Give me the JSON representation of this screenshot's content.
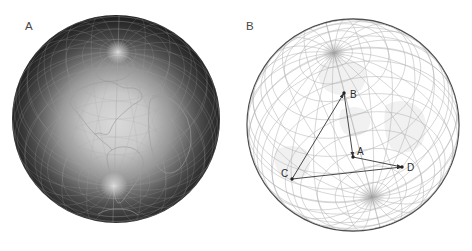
{
  "figure": {
    "background": "#ffffff",
    "panel_a": {
      "label": "A",
      "description": "earth-globe-orthographic",
      "sphere": {
        "cx": 116,
        "cy": 119,
        "r": 104,
        "pole_dx": 2,
        "pole_dy": -67
      },
      "colors": {
        "center": "#dadada",
        "mid": "#979797",
        "edge": "#1c1c1c",
        "grid": "#a9a9a9",
        "continent": "#9c9c9c",
        "pole_glow": "#ffffff"
      }
    },
    "panel_b": {
      "label": "B",
      "description": "transparent-wireframe-sphere",
      "sphere": {
        "cx": 117,
        "cy": 125,
        "r": 106,
        "pole_dx": -19,
        "pole_dy": -72
      },
      "colors": {
        "outline": "#4d4d4d",
        "grid": "#b4b4b4",
        "marks": "#333333",
        "label": "#2b2b2b",
        "landmass": "#efefef",
        "pole_glow": "#8f8f8f"
      },
      "points": {
        "A": {
          "label": "A",
          "x": 117,
          "y": 157,
          "label_x": 121,
          "label_y": 155
        },
        "B": {
          "label": "B",
          "x": 108,
          "y": 93,
          "label_x": 114,
          "label_y": 98
        },
        "C": {
          "label": "C",
          "x": 56,
          "y": 179,
          "label_x": 45,
          "label_y": 177
        },
        "D": {
          "label": "D",
          "x": 166,
          "y": 167,
          "label_x": 171,
          "label_y": 171
        }
      },
      "edges": [
        {
          "from": "C",
          "to": "B",
          "arrow": true
        },
        {
          "from": "B",
          "to": "A",
          "arrow": true
        },
        {
          "from": "A",
          "to": "D",
          "arrow": true
        },
        {
          "from": "C",
          "to": "D",
          "arrow": true
        }
      ]
    }
  }
}
